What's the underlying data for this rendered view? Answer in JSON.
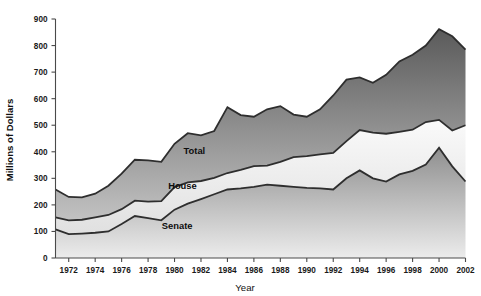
{
  "chart_data": {
    "type": "area",
    "title": "",
    "xlabel": "Year",
    "ylabel": "Millions of Dollars",
    "xlim": [
      1971,
      2002
    ],
    "ylim": [
      0,
      900
    ],
    "ytick_step": 100,
    "xtick_step": 2,
    "grid": false,
    "stacked": true,
    "legend_position": "inline-annotations",
    "x": [
      1971,
      1972,
      1973,
      1974,
      1975,
      1976,
      1977,
      1978,
      1979,
      1980,
      1981,
      1982,
      1983,
      1984,
      1985,
      1986,
      1987,
      1988,
      1989,
      1990,
      1991,
      1992,
      1993,
      1994,
      1995,
      1996,
      1997,
      1998,
      1999,
      2000,
      2001,
      2002
    ],
    "yticks": [
      0,
      100,
      200,
      300,
      400,
      500,
      600,
      700,
      800,
      900
    ],
    "xticks": [
      1972,
      1974,
      1976,
      1978,
      1980,
      1982,
      1984,
      1986,
      1988,
      1990,
      1992,
      1994,
      1996,
      1998,
      2000,
      2002
    ],
    "series": [
      {
        "name": "Senate",
        "label": "Senate",
        "color": "#9a9a9a",
        "gradient_top": "#8e8e8e",
        "gradient_bottom": "#eaeaea",
        "values": [
          108,
          90,
          92,
          95,
          100,
          128,
          158,
          150,
          142,
          182,
          205,
          222,
          240,
          258,
          262,
          268,
          276,
          272,
          268,
          264,
          262,
          258,
          300,
          330,
          300,
          288,
          315,
          328,
          352,
          415,
          345,
          288
        ]
      },
      {
        "name": "House",
        "label": "House",
        "color": "#efefef",
        "gradient_top": "#f7f7f7",
        "gradient_bottom": "#e3e3e3",
        "values": [
          45,
          52,
          52,
          58,
          62,
          56,
          58,
          62,
          72,
          85,
          80,
          68,
          62,
          62,
          70,
          78,
          72,
          90,
          112,
          120,
          128,
          138,
          140,
          152,
          172,
          180,
          160,
          155,
          160,
          105,
          135,
          212
        ]
      }
    ],
    "total": {
      "name": "Total",
      "label": "Total",
      "color": "#8a8a8a",
      "gradient_top": "#5e5e5e",
      "gradient_bottom": "#b9b9b9",
      "values": [
        258,
        230,
        228,
        242,
        272,
        318,
        370,
        368,
        362,
        430,
        470,
        462,
        478,
        568,
        538,
        532,
        560,
        572,
        540,
        532,
        560,
        612,
        672,
        680,
        660,
        690,
        740,
        765,
        800,
        862,
        835,
        785
      ]
    },
    "annotations": [
      {
        "name": "total-label",
        "text": "Total",
        "x": 1981.5,
        "y": 390
      },
      {
        "name": "house-label",
        "text": "House",
        "x": 1980.6,
        "y": 258
      },
      {
        "name": "senate-label",
        "text": "Senate",
        "x": 1980.2,
        "y": 108
      }
    ]
  }
}
